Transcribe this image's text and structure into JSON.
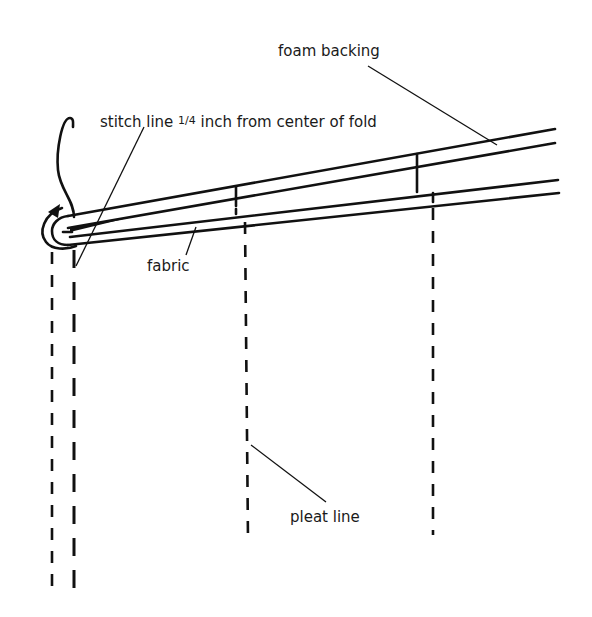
{
  "diagram": {
    "title": "",
    "labels": {
      "foam_backing": "foam backing",
      "stitch_line_pre": "stitch line ",
      "stitch_line_fraction": "1/4",
      "stitch_line_post": " inch from center of fold",
      "fabric": "fabric",
      "pleat_line": "pleat line"
    },
    "colors": {
      "ink": "#111111",
      "background": "#ffffff"
    },
    "elements": [
      {
        "id": "foam-backing-layer",
        "description": "two upper solid lines representing foam backing"
      },
      {
        "id": "fabric-layer",
        "description": "two lower solid lines representing fabric"
      },
      {
        "id": "fold-curl",
        "description": "curved arrow showing fold around the edge"
      },
      {
        "id": "stitch-lines",
        "description": "two vertical dashed lines near the fold"
      },
      {
        "id": "pleat-lines",
        "description": "two vertical dashed pleat lines"
      }
    ]
  }
}
